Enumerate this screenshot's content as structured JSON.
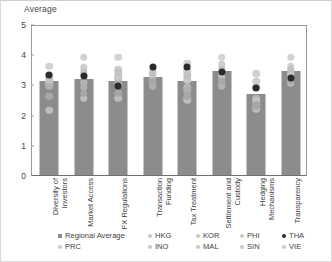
{
  "chart_data": {
    "type": "bar",
    "title": "",
    "ylabel": "Average",
    "xlabel": "",
    "ylim": [
      0,
      5
    ],
    "yticks": [
      0,
      1,
      2,
      3,
      4,
      5
    ],
    "grid": false,
    "legend_position": "bottom",
    "categories": [
      "Diversity of Investors",
      "Market Access",
      "FX Regulations",
      "Transaction Funding",
      "Tax Treatment",
      "Settlement and Custody",
      "Hedging Mechanisms",
      "Transparency"
    ],
    "bar_series": {
      "name": "Regional Average",
      "values": [
        3.1,
        3.17,
        3.12,
        3.25,
        3.1,
        3.43,
        2.68,
        3.45
      ]
    },
    "point_series": [
      {
        "name": "PRC",
        "color": "#d2d2d2",
        "values": [
          3.6,
          3.9,
          3.9,
          3.45,
          3.7,
          3.9,
          3.35,
          3.9
        ]
      },
      {
        "name": "HKG",
        "color": "#cfcfcf",
        "values": [
          3.3,
          3.55,
          3.5,
          3.3,
          3.45,
          3.65,
          3.1,
          3.6
        ]
      },
      {
        "name": "INO",
        "color": "#bdbdbd",
        "values": [
          2.15,
          2.55,
          2.55,
          3.05,
          2.5,
          3.0,
          2.2,
          3.05
        ]
      },
      {
        "name": "KOR",
        "color": "#b5b5b5",
        "values": [
          3.0,
          3.05,
          3.2,
          3.2,
          2.9,
          3.2,
          2.55,
          3.25
        ]
      },
      {
        "name": "MAL",
        "color": "#c7c7c7",
        "values": [
          3.05,
          3.3,
          3.25,
          3.3,
          3.15,
          3.35,
          2.45,
          3.35
        ]
      },
      {
        "name": "PHI",
        "color": "#b0b0b0",
        "values": [
          2.95,
          2.9,
          3.0,
          2.95,
          2.8,
          2.95,
          2.35,
          3.1
        ]
      },
      {
        "name": "SIN",
        "color": "#c2c2c2",
        "values": [
          3.15,
          3.4,
          3.4,
          3.35,
          3.3,
          3.5,
          2.9,
          3.5
        ]
      },
      {
        "name": "THA",
        "color": "#2b2b2b",
        "values": [
          3.3,
          3.28,
          2.95,
          3.58,
          3.57,
          3.42,
          2.88,
          3.22
        ]
      },
      {
        "name": "VIE",
        "color": "#a8a8a8",
        "values": [
          2.6,
          2.7,
          2.7,
          3.1,
          2.6,
          3.1,
          2.3,
          3.15
        ]
      }
    ],
    "legend": [
      {
        "label": "Regional Average",
        "marker": "square",
        "color": "#8c8c8c"
      },
      {
        "label": "PRC",
        "marker": "circle",
        "color": "#c9c9c9"
      },
      {
        "label": "HKG",
        "marker": "circle",
        "color": "#c9c9c9"
      },
      {
        "label": "INO",
        "marker": "circle",
        "color": "#c9c9c9"
      },
      {
        "label": "KOR",
        "marker": "circle",
        "color": "#c9c9c9"
      },
      {
        "label": "MAL",
        "marker": "circle",
        "color": "#c9c9c9"
      },
      {
        "label": "PHI",
        "marker": "circle",
        "color": "#c9c9c9"
      },
      {
        "label": "SIN",
        "marker": "circle",
        "color": "#c9c9c9"
      },
      {
        "label": "THA",
        "marker": "circle",
        "color": "#2b2b2b"
      },
      {
        "label": "VIE",
        "marker": "circle",
        "color": "#c9c9c9"
      }
    ]
  }
}
